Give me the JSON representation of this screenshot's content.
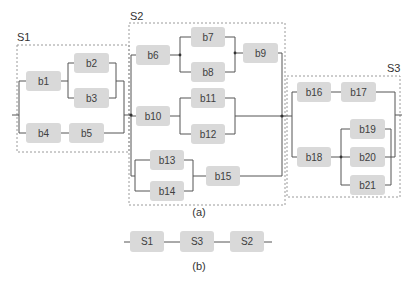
{
  "diagram": {
    "part_a": {
      "caption": "(a)",
      "groups": [
        {
          "id": "S1",
          "label": "S1"
        },
        {
          "id": "S2",
          "label": "S2"
        },
        {
          "id": "S3",
          "label": "S3"
        }
      ],
      "blocks": {
        "b1": "b1",
        "b2": "b2",
        "b3": "b3",
        "b4": "b4",
        "b5": "b5",
        "b6": "b6",
        "b7": "b7",
        "b8": "b8",
        "b9": "b9",
        "b10": "b10",
        "b11": "b11",
        "b12": "b12",
        "b13": "b13",
        "b14": "b14",
        "b15": "b15",
        "b16": "b16",
        "b17": "b17",
        "b18": "b18",
        "b19": "b19",
        "b20": "b20",
        "b21": "b21"
      }
    },
    "part_b": {
      "caption": "(b)",
      "series_blocks": [
        "S1",
        "S3",
        "S2"
      ]
    }
  },
  "colors": {
    "block_fill": "#d9d9d9",
    "wire": "#555555",
    "group_border": "#9a9a9a"
  }
}
